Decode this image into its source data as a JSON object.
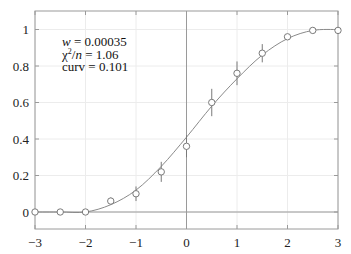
{
  "chart_data": {
    "type": "scatter",
    "title": "",
    "xlabel": "",
    "ylabel": "",
    "xlim": [
      -3,
      3
    ],
    "ylim": [
      -0.1,
      1.1
    ],
    "grid": true,
    "x_ticks": [
      -3,
      -2,
      -1,
      0,
      1,
      2,
      3
    ],
    "x_tick_labels": [
      "−3",
      "−2",
      "−1",
      "0",
      "1",
      "2",
      "3"
    ],
    "y_ticks": [
      0,
      0.2,
      0.4,
      0.6,
      0.8,
      1
    ],
    "y_tick_labels": [
      "0",
      "0.2",
      "0.4",
      "0.6",
      "0.8",
      "1"
    ],
    "series": [
      {
        "name": "data",
        "style": "open-circle-with-errorbars",
        "x": [
          -3,
          -2.5,
          -2,
          -1.5,
          -1,
          -0.5,
          0,
          0.5,
          1,
          1.5,
          2,
          2.5,
          3
        ],
        "y": [
          0.0,
          0.0,
          0.0,
          0.06,
          0.1,
          0.22,
          0.36,
          0.6,
          0.76,
          0.87,
          0.96,
          0.995,
          0.995
        ],
        "yerr": [
          0.0,
          0.0,
          0.0,
          0.02,
          0.04,
          0.055,
          0.06,
          0.075,
          0.065,
          0.05,
          0.0,
          0.0,
          0.0
        ]
      },
      {
        "name": "fit",
        "style": "line",
        "x": [
          -3,
          -2.5,
          -2,
          -1.5,
          -1,
          -0.5,
          0,
          0.5,
          1,
          1.5,
          2,
          2.5,
          3
        ],
        "y": [
          0.0,
          0.0,
          0.0,
          0.04,
          0.12,
          0.25,
          0.41,
          0.58,
          0.73,
          0.86,
          0.95,
          0.995,
          1.0
        ]
      }
    ],
    "reference_lines": {
      "horizontal_y": 0,
      "vertical_x": 0
    },
    "annotations": [
      {
        "text_italic": "w",
        "text": " = 0.00035"
      },
      {
        "text": "χ²/",
        "text_italic": "n",
        "text_tail": " = 1.06"
      },
      {
        "text": "curv = 0.101"
      }
    ]
  },
  "annotations": {
    "line1_var": "w",
    "line1_val": " = 0.00035",
    "line2_pre": "χ",
    "line2_sup": "2",
    "line2_slash": "/",
    "line2_var": "n",
    "line2_val": " = 1.06",
    "line3": "curv = 0.101"
  },
  "colors": {
    "frame": "#9a9a9a",
    "grid": "#ececec",
    "curve": "#8a8a8a",
    "marker": "#7a7a7a",
    "text": "#222222"
  }
}
